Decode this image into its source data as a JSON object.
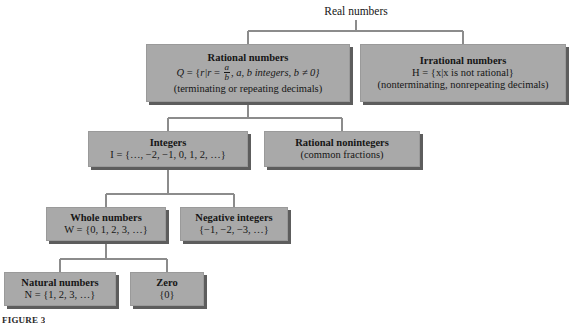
{
  "figure": {
    "root_label": "Real numbers",
    "caption": "FIGURE 3"
  },
  "nodes": {
    "rational": {
      "title": "Rational numbers",
      "formula_prefix": "Q",
      "formula_eq": " = {",
      "formula_set": "r|r",
      "formula_equals2": " = ",
      "frac_num": "a",
      "frac_den": "b",
      "formula_tail": ", a, b integers, b ≠ 0}",
      "sub": "(terminating or repeating decimals)"
    },
    "irrational": {
      "title": "Irrational numbers",
      "formula": "H = {x|x is not rational}",
      "sub": "(nonterminating, nonrepeating decimals)"
    },
    "integers": {
      "title": "Integers",
      "formula": "I = {…, −2, −1, 0, 1, 2, …}"
    },
    "rational_nonintegers": {
      "title": "Rational nonintegers",
      "sub": "(common fractions)"
    },
    "whole": {
      "title": "Whole numbers",
      "formula": "W = {0, 1, 2, 3, …}"
    },
    "negative": {
      "title": "Negative integers",
      "formula": "{−1, −2, −3, …}"
    },
    "natural": {
      "title": "Natural numbers",
      "formula": "N = {1, 2, 3, …}"
    },
    "zero": {
      "title": "Zero",
      "formula": "{0}"
    }
  },
  "colors": {
    "box_fill": "#a9a9a9",
    "box_shadow": "#5d5d5d",
    "connector": "#8c8c8c",
    "text": "#161616",
    "background": "#ffffff"
  }
}
